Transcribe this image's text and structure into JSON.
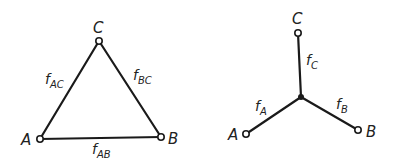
{
  "triangle": {
    "nodes": {
      "A": {
        "label": "A",
        "x": 40,
        "y": 139
      },
      "B": {
        "label": "B",
        "x": 161,
        "y": 137
      },
      "C": {
        "label": "C",
        "x": 99,
        "y": 41
      }
    },
    "edges": {
      "AC": {
        "f": "f",
        "sub": "AC"
      },
      "BC": {
        "f": "f",
        "sub": "BC"
      },
      "AB": {
        "f": "f",
        "sub": "AB"
      }
    }
  },
  "star": {
    "center": {
      "x": 301,
      "y": 97
    },
    "nodes": {
      "A": {
        "label": "A",
        "x": 246,
        "y": 134
      },
      "B": {
        "label": "B",
        "x": 358,
        "y": 130
      },
      "C": {
        "label": "C",
        "x": 298,
        "y": 33
      }
    },
    "edges": {
      "A": {
        "f": "f",
        "sub": "A"
      },
      "B": {
        "f": "f",
        "sub": "B"
      },
      "C": {
        "f": "f",
        "sub": "C"
      }
    }
  }
}
